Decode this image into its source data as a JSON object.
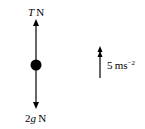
{
  "diagram": {
    "type": "force-diagram",
    "particle": {
      "shape": "filled-circle",
      "color": "#000000"
    },
    "forces": [
      {
        "direction": "up",
        "label_var": "T",
        "label_unit": "N"
      },
      {
        "direction": "down",
        "label_var": "2g",
        "label_coef": "2",
        "label_sym": "g",
        "label_unit": "N"
      }
    ],
    "acceleration": {
      "direction": "up",
      "arrow": "double-head",
      "value": "5",
      "unit": "ms",
      "exponent": "−2"
    }
  }
}
